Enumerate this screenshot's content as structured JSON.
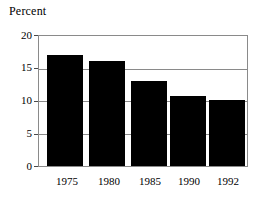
{
  "chart_data": {
    "type": "bar",
    "title": "Percent",
    "xlabel": "",
    "ylabel": "Percent",
    "categories": [
      "1975",
      "1980",
      "1985",
      "1990",
      "1992"
    ],
    "values": [
      17.1,
      16.2,
      13.0,
      10.7,
      10.1
    ],
    "series": [
      {
        "name": "Percent",
        "values": [
          17.1,
          16.2,
          13.0,
          10.7,
          10.1
        ]
      }
    ],
    "ylim": [
      0,
      20
    ],
    "yticks": [
      0,
      5,
      10,
      15,
      20
    ],
    "ytick_labels": [
      "0",
      "5",
      "10",
      "15",
      "20"
    ],
    "grid": true,
    "gridlines_at": [
      5,
      10,
      15
    ],
    "legend": false,
    "legend_position": "none",
    "bar_color": "#000000",
    "frame_color": "#8a8a8a",
    "grid_color": "#8a8a8a",
    "background_color": "#ffffff"
  }
}
